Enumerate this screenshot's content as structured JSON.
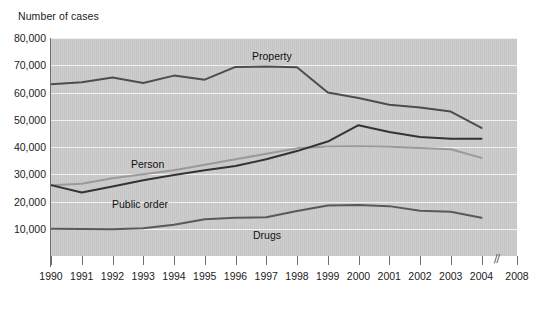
{
  "chart_data": {
    "type": "line",
    "title": "",
    "ylabel": "Number of cases",
    "xlabel": "",
    "grid": true,
    "legend_position": "inline-labels",
    "ylim": [
      0,
      80000
    ],
    "yticks": [
      10000,
      20000,
      30000,
      40000,
      50000,
      60000,
      70000,
      80000
    ],
    "ytick_labels": [
      "10,000",
      "20,000",
      "30,000",
      "40,000",
      "50,000",
      "60,000",
      "70,000",
      "80,000"
    ],
    "x": [
      1990,
      1991,
      1992,
      1993,
      1994,
      1995,
      1996,
      1997,
      1998,
      1999,
      2000,
      2001,
      2002,
      2003,
      2004
    ],
    "xtick_labels": [
      "1990",
      "1991",
      "1992",
      "1993",
      "1994",
      "1995",
      "1996",
      "1997",
      "1998",
      "1999",
      "2000",
      "2001",
      "2002",
      "2003",
      "2004",
      "2008"
    ],
    "axis_break": "//",
    "axis_break_after": "2004",
    "series": [
      {
        "name": "Property",
        "label": "Property",
        "color": "#4d4d4d",
        "values": [
          63000,
          63800,
          65500,
          63500,
          66200,
          64700,
          69400,
          69500,
          69300,
          60000,
          58000,
          55500,
          54500,
          53000,
          47000
        ]
      },
      {
        "name": "Person",
        "label": "Person",
        "color": "#9a9a9a",
        "values": [
          26000,
          26500,
          28500,
          30000,
          31500,
          33500,
          35500,
          37500,
          39500,
          40200,
          40300,
          40100,
          39600,
          39200,
          36000
        ]
      },
      {
        "name": "Public order",
        "label": "Public order",
        "color": "#333333",
        "values": [
          26000,
          23300,
          25500,
          27800,
          29700,
          31500,
          33000,
          35500,
          38500,
          42000,
          48000,
          45500,
          43700,
          43000,
          43000
        ]
      },
      {
        "name": "Drugs",
        "label": "Drugs",
        "color": "#595959",
        "values": [
          10000,
          9900,
          9800,
          10200,
          11500,
          13500,
          14000,
          14200,
          16500,
          18500,
          18700,
          18300,
          16600,
          16200,
          14000
        ]
      }
    ]
  },
  "labels": {
    "property": "Property",
    "person": "Person",
    "public_order": "Public order",
    "drugs": "Drugs"
  }
}
